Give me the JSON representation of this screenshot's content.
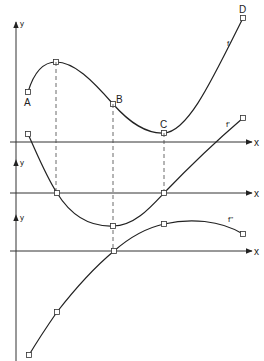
{
  "diagram": {
    "panels": [
      {
        "id": "f",
        "curve_label": "f",
        "y_axis_label": "y",
        "x_axis_label": "x",
        "points": [
          {
            "label": "A",
            "meaning": "start point"
          },
          {
            "label": "",
            "meaning": "local maximum"
          },
          {
            "label": "B",
            "meaning": "inflection point"
          },
          {
            "label": "C",
            "meaning": "local minimum"
          },
          {
            "label": "D",
            "meaning": "end point"
          }
        ]
      },
      {
        "id": "f-prime",
        "curve_label": "f'",
        "y_axis_label": "y",
        "x_axis_label": "x",
        "points": [
          {
            "label": "",
            "meaning": "start point"
          },
          {
            "label": "",
            "meaning": "zero at local max of f"
          },
          {
            "label": "",
            "meaning": "minimum at inflection of f"
          },
          {
            "label": "",
            "meaning": "zero at local min of f"
          },
          {
            "label": "",
            "meaning": "end point"
          }
        ]
      },
      {
        "id": "f-double-prime",
        "curve_label": "f''",
        "y_axis_label": "y",
        "x_axis_label": "x",
        "points": [
          {
            "label": "",
            "meaning": "start point"
          },
          {
            "label": "",
            "meaning": "point below local max"
          },
          {
            "label": "",
            "meaning": "zero at inflection of f"
          },
          {
            "label": "",
            "meaning": "point below local min"
          },
          {
            "label": "",
            "meaning": "end point"
          }
        ]
      }
    ]
  }
}
